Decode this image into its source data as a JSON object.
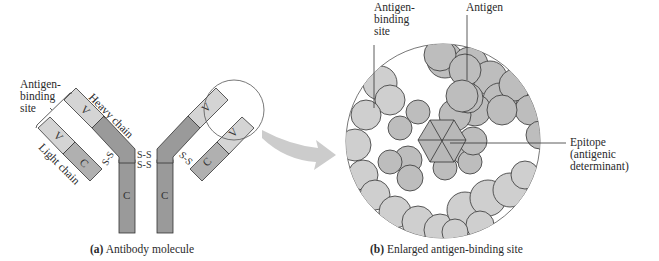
{
  "figure": {
    "panel_a": {
      "caption_letter": "(a)",
      "caption_text": " Antibody molecule",
      "labels": {
        "antigen_binding_site_line1": "Antigen-",
        "antigen_binding_site_line2": "binding",
        "antigen_binding_site_line3": "site",
        "heavy_chain": "Heavy chain",
        "light_chain": "Light chain",
        "disulfide": "S-S",
        "variable_region": "V",
        "constant_region": "C"
      }
    },
    "panel_b": {
      "caption_letter": "(b)",
      "caption_text": " Enlarged antigen-binding site",
      "labels": {
        "antigen_binding_site_line1": "Antigen-",
        "antigen_binding_site_line2": "binding",
        "antigen_binding_site_line3": "site",
        "antigen": "Antigen",
        "epitope_line1": "Epitope",
        "epitope_line2": "(antigenic",
        "epitope_line3": "determinant)"
      }
    },
    "colors": {
      "heavy_constant": "#9a9a9a",
      "variable": "#d4d4d4",
      "light_constant": "#b0b0b0",
      "antigen_atoms": "#bdbdbd",
      "binding_atoms": "#cfcfcf",
      "arrow": "#cccccc",
      "outline": "#333333"
    }
  }
}
